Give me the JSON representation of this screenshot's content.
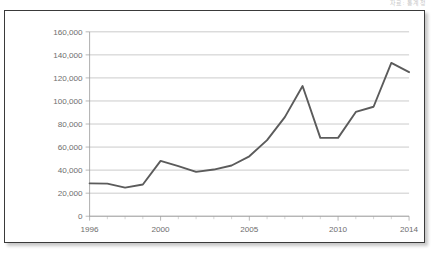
{
  "header": {
    "watermark_text": "자료: 통계청"
  },
  "chart_data": {
    "type": "line",
    "title": "",
    "subtitle": "",
    "xlabel": "",
    "ylabel": "",
    "x": [
      1996,
      1997,
      1998,
      1999,
      2000,
      2001,
      2002,
      2003,
      2004,
      2005,
      2006,
      2007,
      2008,
      2009,
      2010,
      2011,
      2012,
      2013,
      2014
    ],
    "values": [
      28500,
      28300,
      24800,
      27500,
      48000,
      43500,
      38500,
      40500,
      44000,
      52000,
      66000,
      86000,
      113000,
      68000,
      68000,
      90500,
      95000,
      133000,
      125000
    ],
    "series": [
      {
        "name": "series-1",
        "values": [
          28500,
          28300,
          24800,
          27500,
          48000,
          43500,
          38500,
          40500,
          44000,
          52000,
          66000,
          86000,
          113000,
          68000,
          68000,
          90500,
          95000,
          133000,
          125000
        ]
      }
    ],
    "ylim": [
      0,
      160000
    ],
    "xlim": [
      1996,
      2014
    ],
    "y_ticks": [
      0,
      20000,
      40000,
      60000,
      80000,
      100000,
      120000,
      140000,
      160000
    ],
    "y_tick_labels": [
      "0",
      "20,000",
      "40,000",
      "60,000",
      "80,000",
      "100,000",
      "120,000",
      "140,000",
      "160,000"
    ],
    "x_ticks": [
      1996,
      1997,
      1998,
      1999,
      2000,
      2001,
      2002,
      2003,
      2004,
      2005,
      2006,
      2007,
      2008,
      2009,
      2010,
      2011,
      2012,
      2013,
      2014
    ],
    "x_tick_labels": [
      1996,
      2000,
      2005,
      2010,
      2014
    ],
    "grid": true,
    "legend": false,
    "legend_position": "none",
    "line_color": "#5b5b5b",
    "grid_color": "#b4b4b4",
    "axis_color": "#9a9a9a",
    "background_color": "#ffffff",
    "border_color": "#3a3a3a"
  }
}
